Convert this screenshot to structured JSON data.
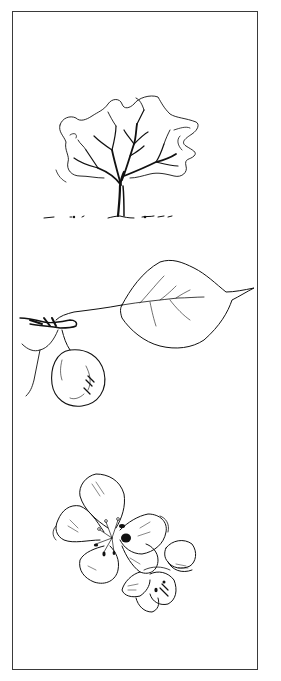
{
  "illustration": {
    "description": "Botanical pen-and-ink plate: tree habit, leaf with fruit, and flower cluster",
    "colors": {
      "ink": "#111111",
      "border": "#3a3a3a",
      "background": "#ffffff"
    },
    "panels": [
      {
        "id": "tree",
        "subject": "tree-habit-sketch"
      },
      {
        "id": "leaf-fruit",
        "subject": "twig-with-leaf-and-fruit"
      },
      {
        "id": "flower",
        "subject": "blossom-cluster"
      }
    ]
  }
}
